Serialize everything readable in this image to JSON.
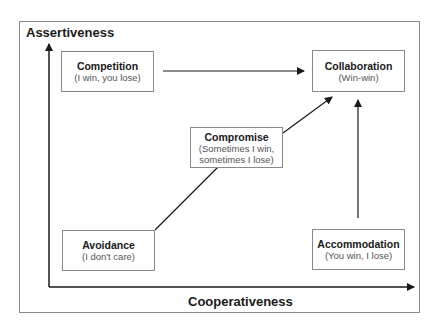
{
  "axes": {
    "y_label": "Assertiveness",
    "x_label": "Cooperativeness"
  },
  "boxes": {
    "competition": {
      "title": "Competition",
      "subtitle": "(I win, you lose)"
    },
    "collaboration": {
      "title": "Collaboration",
      "subtitle": "(Win-win)"
    },
    "compromise": {
      "title": "Compromise",
      "subtitle_line1": "(Sometimes I win,",
      "subtitle_line2": "sometimes I lose)"
    },
    "avoidance": {
      "title": "Avoidance",
      "subtitle": "(I don't care)"
    },
    "accommodation": {
      "title": "Accommodation",
      "subtitle": "(You win, I lose)"
    }
  },
  "arrows": [
    {
      "from": "Competition",
      "to": "Collaboration"
    },
    {
      "from": "Avoidance",
      "to": "Compromise"
    },
    {
      "from": "Compromise",
      "to": "Collaboration"
    },
    {
      "from": "Accommodation",
      "to": "Collaboration"
    }
  ],
  "colors": {
    "axis": "#1a1a1a",
    "box_border": "#8a8a8a",
    "frame_border": "#8a8a8a",
    "subtitle_text": "#555555"
  }
}
